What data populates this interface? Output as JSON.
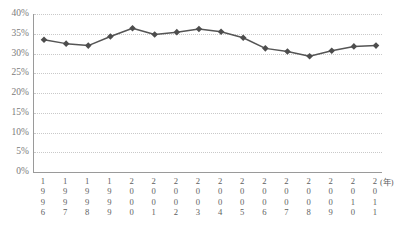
{
  "chart_data": {
    "type": "line",
    "title": "",
    "subtitle": "",
    "xlabel": "(年)",
    "ylabel": "",
    "categories": [
      "1996",
      "1997",
      "1998",
      "1999",
      "2000",
      "2001",
      "2002",
      "2003",
      "2004",
      "2005",
      "2006",
      "2007",
      "2008",
      "2009",
      "2010",
      "2011"
    ],
    "values": [
      33.5,
      32.5,
      32.0,
      34.3,
      36.4,
      34.8,
      35.4,
      36.2,
      35.5,
      34.0,
      31.3,
      30.5,
      29.3,
      30.7,
      31.8,
      32.0
    ],
    "ylim": [
      0,
      40
    ],
    "yticks": [
      0,
      5,
      10,
      15,
      20,
      25,
      30,
      35,
      40
    ],
    "ytick_labels": [
      "0%",
      "5%",
      "10%",
      "15%",
      "20%",
      "25%",
      "30%",
      "35%",
      "40%"
    ],
    "grid": true,
    "grid_style": "dotted-horizontal",
    "legend": "none",
    "series_color": "#555555",
    "marker": "diamond",
    "marker_color": "#4d4d4d",
    "axis_color": "#9a9a9a"
  }
}
